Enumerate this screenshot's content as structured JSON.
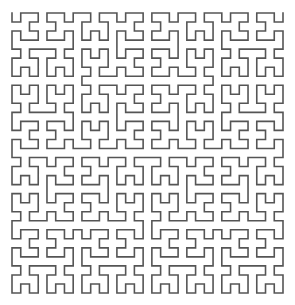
{
  "diagram": {
    "type": "space-filling-curve",
    "curve": {
      "kind": "hilbert",
      "order": 5,
      "stroke_color": "#555555",
      "stroke_width": 1.6,
      "bounds": {
        "x": 12,
        "y": 13,
        "width": 271,
        "height": 280
      },
      "start_point": [
        12,
        13
      ],
      "end_point": [
        283,
        293
      ]
    },
    "background_color": "#ffffff"
  }
}
